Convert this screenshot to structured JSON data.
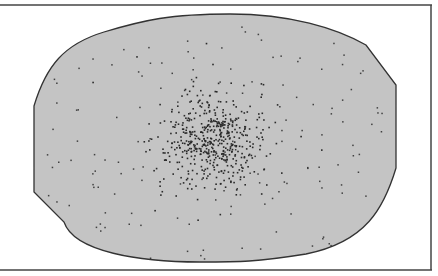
{
  "figure": {
    "colors": {
      "background": "#ffffff",
      "region_fill": "#c4c4c4",
      "outline": "#333333",
      "frame": "#444444",
      "dots": "#2a2a2a"
    },
    "frame": {
      "top_y": 5,
      "bottom_y": 270,
      "right_x": 431,
      "left_open": true
    },
    "region": {
      "left_cut": {
        "x": 34,
        "y_top": 106,
        "y_bottom": 192
      },
      "right_cut": {
        "x": 396,
        "y_top": 85,
        "y_bottom": 168
      },
      "top_peak": {
        "x": 230,
        "y": 14
      },
      "bottom_peak": {
        "x": 200,
        "y": 262
      }
    },
    "cluster": {
      "center_x": 212,
      "center_y": 140,
      "spread_x": 28,
      "spread_y": 24,
      "dense_count": 520,
      "sparse_count": 170,
      "seed": 7
    }
  }
}
